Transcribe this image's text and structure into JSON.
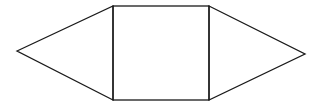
{
  "diagram": {
    "stroke_color": "#1a1a1a",
    "background": "#ffffff",
    "shapes": {
      "left_triangle": {
        "apex": [
          17,
          51
        ],
        "top": [
          113,
          6
        ],
        "bottom": [
          113,
          100
        ]
      },
      "square": {
        "top_left": [
          113,
          6
        ],
        "top_right": [
          209,
          6
        ],
        "bottom_right": [
          209,
          100
        ],
        "bottom_left": [
          113,
          100
        ]
      },
      "right_triangle": {
        "apex": [
          305,
          54
        ],
        "top": [
          209,
          6
        ],
        "bottom": [
          209,
          100
        ]
      }
    }
  }
}
